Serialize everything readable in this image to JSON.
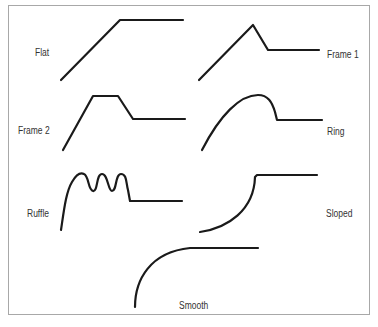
{
  "diagram": {
    "type": "envelope-profile-shapes",
    "stroke_color": "#1a1a1a",
    "border_color": "#a8a8a8",
    "shapes": [
      {
        "name": "flat",
        "label": "Flat"
      },
      {
        "name": "frame1",
        "label": "Frame 1"
      },
      {
        "name": "frame2",
        "label": "Frame 2"
      },
      {
        "name": "ring",
        "label": "Ring"
      },
      {
        "name": "ruffle",
        "label": "Ruffle"
      },
      {
        "name": "sloped",
        "label": "Sloped"
      },
      {
        "name": "smooth",
        "label": "Smooth"
      }
    ]
  }
}
